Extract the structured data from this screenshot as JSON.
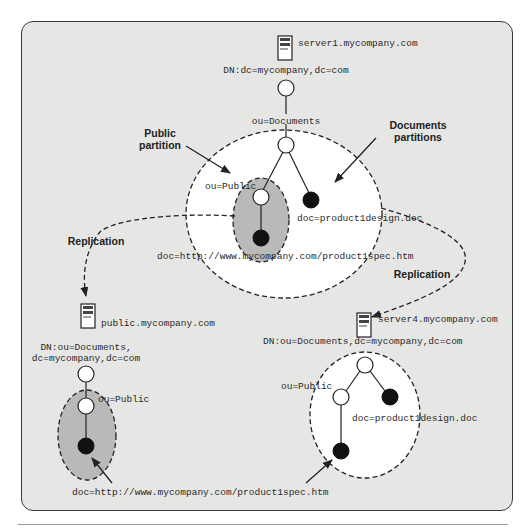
{
  "diagram": {
    "title_hidden": "",
    "servers": [
      {
        "id": "server1",
        "label": "server1.mycompany.com",
        "dn": "DN:dc=mycompany,dc=com"
      },
      {
        "id": "public",
        "label": "public.mycompany.com",
        "dn_line1": "DN:ou=Documents,",
        "dn_line2": "dc=mycompany,dc=com"
      },
      {
        "id": "server4",
        "label": "server4.mycompany.com",
        "dn": "DN:ou=Documents,dc=mycompany,dc=com"
      }
    ],
    "top_tree": {
      "ou_documents": "ou=Documents",
      "ou_public": "ou=Public",
      "doc_design": "doc=product1design.doc",
      "doc_spec": "doc=http://www.mycompany.com/product1spec.htm"
    },
    "left_tree": {
      "ou_public": "ou=Public",
      "doc_spec": "doc=http://www.mycompany.com/product1spec.htm"
    },
    "right_tree": {
      "ou_public": "ou=Public",
      "doc_design": "doc=product1design.doc"
    },
    "callouts": {
      "public_partition_line1": "Public",
      "public_partition_line2": "partition",
      "documents_partitions_line1": "Documents",
      "documents_partitions_line2": "partitions",
      "replication_left": "Replication",
      "replication_right": "Replication"
    },
    "colors": {
      "background": "#e6e6e4",
      "partition_white": "#ffffff",
      "partition_gray": "#b9b9b7",
      "node_filled": "#111111",
      "line": "#222222"
    }
  }
}
